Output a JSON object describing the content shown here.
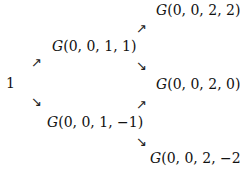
{
  "nodes": {
    "root": "1",
    "n11": {
      "fn": "G",
      "args": "(0, 0, 1, 1)"
    },
    "n1m1": {
      "fn": "G",
      "args": "(0, 0, 1, −1)"
    },
    "n22": {
      "fn": "G",
      "args": "(0, 0, 2, 2)"
    },
    "n20": {
      "fn": "G",
      "args": "(0, 0, 2, 0)"
    },
    "n2m2": {
      "fn": "G",
      "args": "(0, 0, 2, −2)"
    }
  },
  "arrows": {
    "up": "↗",
    "down": "↘"
  }
}
